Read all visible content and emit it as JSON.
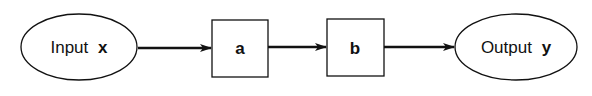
{
  "diagram": {
    "nodes": [
      {
        "id": "input",
        "shape": "ellipse",
        "label": "Input",
        "var": "x"
      },
      {
        "id": "a",
        "shape": "box",
        "label": "a"
      },
      {
        "id": "b",
        "shape": "box",
        "label": "b"
      },
      {
        "id": "output",
        "shape": "ellipse",
        "label": "Output",
        "var": "y"
      }
    ],
    "edges": [
      {
        "from": "input",
        "to": "a"
      },
      {
        "from": "a",
        "to": "b"
      },
      {
        "from": "b",
        "to": "output"
      }
    ],
    "colors": {
      "stroke": "#111111",
      "background": "#ffffff"
    }
  }
}
